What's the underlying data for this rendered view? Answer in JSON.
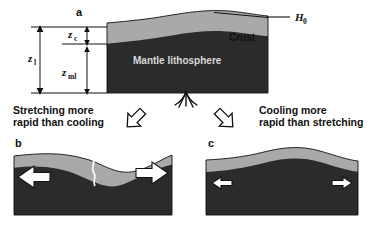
{
  "figure": {
    "title_hidden": "",
    "colors": {
      "crust": "#a9a9a9",
      "mantle": "#2b2b2b",
      "outline": "#111111",
      "arrow_fill": "#ffffff",
      "background": "#ffffff"
    }
  },
  "panel_a": {
    "letter": "a",
    "crust_label": "Crust",
    "mantle_label": "Mantle lithosphere",
    "reference_level_label": "H",
    "reference_level_sub": "0",
    "dimensions": [
      {
        "name": "lithosphere-thickness",
        "symbol": "z",
        "subscript": "l"
      },
      {
        "name": "crust-thickness",
        "symbol": "z",
        "subscript": "c"
      },
      {
        "name": "mantle-lithosphere-thickness",
        "symbol": "z",
        "subscript": "ml"
      }
    ],
    "upwelling_icon": "mantle-plume-fountain"
  },
  "transition_left": {
    "line1": "Stretching more",
    "line2": "rapid than cooling",
    "arrow_icon": "block-arrow-down-left"
  },
  "transition_right": {
    "line1": "Cooling more",
    "line2": "rapid than stretching",
    "arrow_icon": "block-arrow-down-right"
  },
  "panel_b": {
    "letter": "b",
    "left_arrow_icon": "large-arrow-left",
    "right_arrow_icon": "large-arrow-right",
    "rift_icon": "crustal-fissure"
  },
  "panel_c": {
    "letter": "c",
    "left_arrow_icon": "small-arrow-left",
    "right_arrow_icon": "small-arrow-right"
  }
}
